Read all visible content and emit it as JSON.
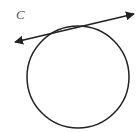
{
  "diagram": {
    "label": "C",
    "label_pos": {
      "x": 16,
      "y": 7
    },
    "circle": {
      "cx": 78,
      "cy": 77,
      "r": 51,
      "stroke": "#222222"
    },
    "tangent_line": {
      "x1": 15,
      "y1": 42,
      "x2": 134,
      "y2": 14,
      "stroke": "#222222",
      "arrows": "both"
    }
  }
}
